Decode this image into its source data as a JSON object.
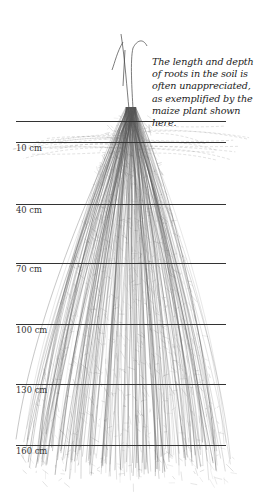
{
  "caption": "The length and depth of roots in the soil is often unappreciated, as exemplified by the maize plant shown here.",
  "colors": {
    "background": "#ffffff",
    "line": "#333333",
    "roots": "#555555",
    "text": "#222222"
  },
  "surface_line": {
    "y": 121
  },
  "depth_markers": [
    {
      "label": "10 cm",
      "y": 142
    },
    {
      "label": "40 cm",
      "y": 204
    },
    {
      "label": "70 cm",
      "y": 263
    },
    {
      "label": "100 cm",
      "y": 324
    },
    {
      "label": "130 cm",
      "y": 384
    },
    {
      "label": "160 cm",
      "y": 445
    }
  ],
  "plant": {
    "type": "maize",
    "stem_base_x": 131,
    "stem_top_y": 34,
    "surface_y": 121,
    "root_bottom_y": 482
  }
}
